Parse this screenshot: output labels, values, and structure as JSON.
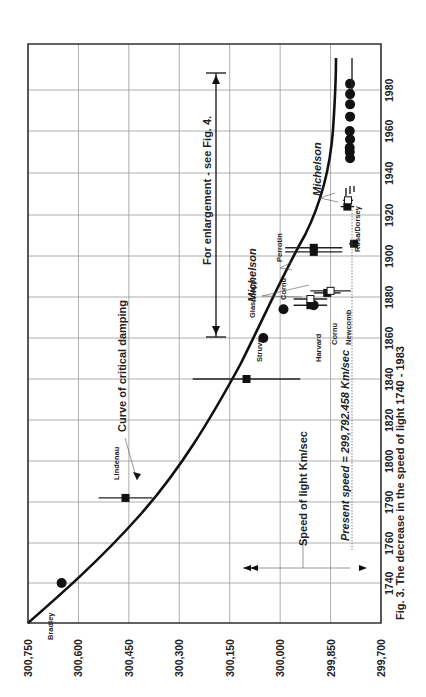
{
  "chart_data": {
    "type": "scatter",
    "orientation": "rotated-90",
    "title": "Fig. 3. The decrease in the speed of light 1740 - 1983",
    "xlabel": "Year",
    "ylabel": "Speed of light  Km/sec",
    "x_ticks": [
      "1740",
      "1760",
      "1790",
      "1800",
      "1820",
      "1840",
      "1860",
      "1880",
      "1900",
      "1920",
      "1940",
      "1960",
      "1980"
    ],
    "y_ticks": [
      "300,750",
      "300,600",
      "300,450",
      "300,300",
      "300,150",
      "300,000",
      "299,850",
      "299,700"
    ],
    "ylim": [
      299700,
      300750
    ],
    "grid": true,
    "annotations": {
      "curve_label": "Curve of critical damping",
      "enlargement": "For enlargement - see Fig. 4.",
      "axis_label": "Speed of light  Km/sec",
      "present_speed": "Present speed = 299,792.458 Km/sec",
      "michelson_1": "Michelson",
      "michelson_2": "Michelson"
    },
    "series": [
      {
        "name": "Bradley",
        "year": 1740,
        "value": 300650,
        "marker": "circle"
      },
      {
        "name": "Lindenau",
        "year": 1791,
        "value": 300460,
        "marker": "square",
        "error": 80
      },
      {
        "name": "Struve",
        "year": 1840,
        "value": 300100,
        "marker": "square",
        "error": 160
      },
      {
        "name": "Glasenapp",
        "year": 1860,
        "value": 300050,
        "marker": "circle"
      },
      {
        "name": "Cornu",
        "year": 1874,
        "value": 299990,
        "marker": "circle"
      },
      {
        "name": "Harvard",
        "year": 1876,
        "value": 299910,
        "marker": "square",
        "error": 50
      },
      {
        "name": "Cornu",
        "year": 1876,
        "value": 299900,
        "marker": "circle"
      },
      {
        "name": "Michelson",
        "year": 1879,
        "value": 299910,
        "marker": "open-square",
        "error": 50
      },
      {
        "name": "Newcomb",
        "year": 1882,
        "value": 299860,
        "marker": "square",
        "error": 40
      },
      {
        "name": "Michelson",
        "year": 1883,
        "value": 299850,
        "marker": "open-square",
        "error": 60
      },
      {
        "name": "Perrotin",
        "year": 1902,
        "value": 299900,
        "marker": "square",
        "error": 85
      },
      {
        "name": "Perrotin",
        "year": 1904,
        "value": 299900,
        "marker": "square",
        "error": 85
      },
      {
        "name": "Rosa/Dorsey",
        "year": 1906,
        "value": 299780,
        "marker": "square",
        "error": 15
      },
      {
        "name": "Michelson",
        "year": 1924,
        "value": 299800,
        "marker": "square",
        "error": 20
      },
      {
        "name": "Michelson",
        "year": 1927,
        "value": 299798,
        "marker": "open-square",
        "error": 15
      },
      {
        "name": "Modern",
        "year": 1947,
        "value": 299792,
        "marker": "circle"
      },
      {
        "name": "Modern",
        "year": 1950,
        "value": 299793,
        "marker": "circle"
      },
      {
        "name": "Modern",
        "year": 1952,
        "value": 299793,
        "marker": "circle"
      },
      {
        "name": "Modern",
        "year": 1956,
        "value": 299792,
        "marker": "circle"
      },
      {
        "name": "Modern",
        "year": 1960,
        "value": 299793,
        "marker": "circle"
      },
      {
        "name": "Modern",
        "year": 1967,
        "value": 299792,
        "marker": "circle"
      },
      {
        "name": "Modern",
        "year": 1973,
        "value": 299792,
        "marker": "circle"
      },
      {
        "name": "Modern",
        "year": 1978,
        "value": 299792,
        "marker": "circle"
      },
      {
        "name": "Modern",
        "year": 1983,
        "value": 299792,
        "marker": "circle"
      }
    ]
  }
}
